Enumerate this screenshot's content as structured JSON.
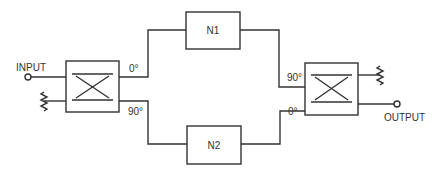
{
  "diagram": {
    "type": "balanced-amplifier-block-diagram",
    "labels": {
      "input": "INPUT",
      "output": "OUTPUT",
      "n1": "N1",
      "n2": "N2",
      "left_top_phase": "0°",
      "left_bottom_phase": "90°",
      "right_top_phase": "90°",
      "right_bottom_phase": "0°"
    },
    "nodes": [
      {
        "id": "input-port",
        "kind": "terminal",
        "label": "INPUT"
      },
      {
        "id": "input-termination",
        "kind": "resistor-to-ground"
      },
      {
        "id": "input-hybrid-coupler",
        "kind": "90-degree-hybrid"
      },
      {
        "id": "n1",
        "kind": "network",
        "label": "N1"
      },
      {
        "id": "n2",
        "kind": "network",
        "label": "N2"
      },
      {
        "id": "output-hybrid-coupler",
        "kind": "90-degree-hybrid"
      },
      {
        "id": "output-termination",
        "kind": "resistor-to-ground"
      },
      {
        "id": "output-port",
        "kind": "terminal",
        "label": "OUTPUT"
      }
    ],
    "edges": [
      {
        "from": "input-port",
        "to": "input-hybrid-coupler"
      },
      {
        "from": "input-termination",
        "to": "input-hybrid-coupler"
      },
      {
        "from": "input-hybrid-coupler",
        "to": "n1",
        "phase": "0°"
      },
      {
        "from": "input-hybrid-coupler",
        "to": "n2",
        "phase": "90°"
      },
      {
        "from": "n1",
        "to": "output-hybrid-coupler",
        "phase": "90°"
      },
      {
        "from": "n2",
        "to": "output-hybrid-coupler",
        "phase": "0°"
      },
      {
        "from": "output-hybrid-coupler",
        "to": "output-termination"
      },
      {
        "from": "output-hybrid-coupler",
        "to": "output-port"
      }
    ]
  }
}
